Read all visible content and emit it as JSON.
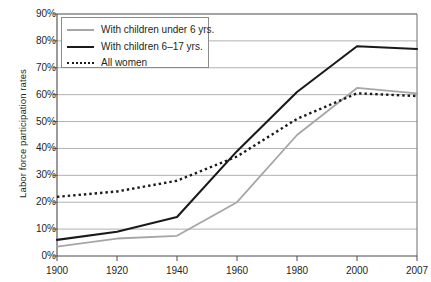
{
  "chart_data": {
    "type": "line",
    "title": "",
    "xlabel": "",
    "ylabel": "Labor force participation rates",
    "x": [
      1900,
      1920,
      1940,
      1960,
      1980,
      2000,
      2007
    ],
    "categories": [
      "1900",
      "1920",
      "1940",
      "1960",
      "1980",
      "2000",
      "2007"
    ],
    "xlim": [
      1900,
      2007
    ],
    "ylim": [
      0,
      90
    ],
    "ytick_labels": [
      "0%",
      "10%",
      "20%",
      "30%",
      "40%",
      "50%",
      "60%",
      "70%",
      "80%",
      "90%"
    ],
    "ytick_values": [
      0,
      10,
      20,
      30,
      40,
      50,
      60,
      70,
      80,
      90
    ],
    "grid": "horizontal",
    "legend_position": "top-left",
    "series": [
      {
        "name": "With children under 6 yrs.",
        "style": "solid",
        "color": "#a6a6a6",
        "values": [
          3.5,
          6.5,
          7.5,
          20,
          45,
          62.5,
          60.5
        ]
      },
      {
        "name": "With children 6–17 yrs.",
        "style": "solid",
        "color": "#1a1a1a",
        "values": [
          6,
          9,
          14.5,
          39,
          61,
          78,
          77
        ]
      },
      {
        "name": "All women",
        "style": "dotted",
        "color": "#1a1a1a",
        "values": [
          22,
          24,
          28,
          37,
          51,
          60.5,
          59.5
        ]
      }
    ]
  },
  "legend": {
    "items": [
      {
        "label": "With children under 6 yrs."
      },
      {
        "label": "With children 6–17 yrs."
      },
      {
        "label": "All women"
      }
    ]
  }
}
